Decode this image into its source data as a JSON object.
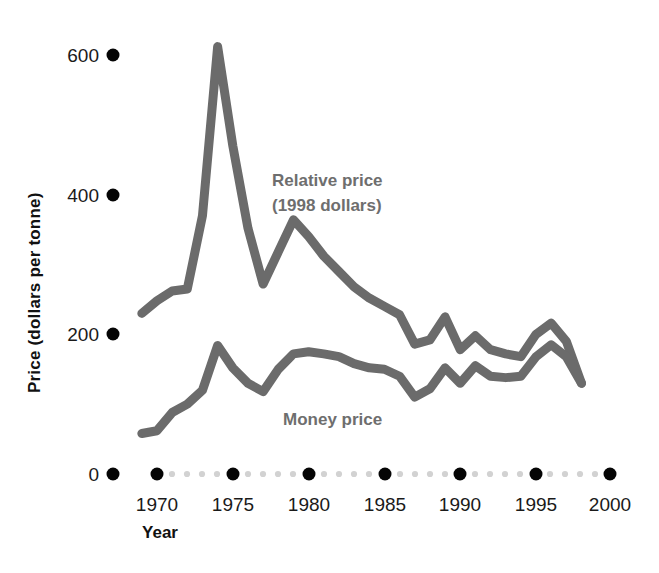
{
  "figure": {
    "background_color": "#ffffff",
    "series_color": "#6b6b6b",
    "label_color": "#6e6e6e",
    "tick_color": "#050505",
    "minor_tick_color": "#d2d2d2"
  },
  "axes": {
    "y_axis_title": "Price (dollars per tonne)",
    "x_axis_title": "Year",
    "y_ticks": [
      "0",
      "200",
      "400",
      "600"
    ],
    "x_ticks": [
      "1970",
      "1975",
      "1980",
      "1985",
      "1990",
      "1995",
      "2000"
    ]
  },
  "annotations": {
    "relative_price_line1": "Relative price",
    "relative_price_line2": "(1998 dollars)",
    "money_price": "Money price"
  },
  "chart_data": {
    "type": "line",
    "title": "",
    "xlabel": "Year",
    "ylabel": "Price (dollars per tonne)",
    "xlim": [
      1968,
      2001
    ],
    "ylim": [
      0,
      680
    ],
    "grid": false,
    "legend": "inline-annotations",
    "x": [
      1969,
      1970,
      1971,
      1972,
      1973,
      1974,
      1975,
      1976,
      1977,
      1978,
      1979,
      1980,
      1981,
      1982,
      1983,
      1984,
      1985,
      1986,
      1987,
      1988,
      1989,
      1990,
      1991,
      1992,
      1993,
      1994,
      1995,
      1996,
      1997,
      1998
    ],
    "series": [
      {
        "name": "Relative price (1998 dollars)",
        "color": "#6b6b6b",
        "values": [
          230,
          248,
          262,
          265,
          370,
          612,
          470,
          352,
          272,
          318,
          364,
          340,
          312,
          290,
          268,
          252,
          240,
          228,
          186,
          192,
          225,
          178,
          198,
          178,
          172,
          168,
          200,
          216,
          190,
          130
        ]
      },
      {
        "name": "Money price",
        "color": "#6b6b6b",
        "values": [
          58,
          62,
          88,
          100,
          120,
          184,
          152,
          130,
          118,
          150,
          172,
          175,
          172,
          168,
          158,
          152,
          150,
          140,
          110,
          122,
          152,
          130,
          155,
          140,
          138,
          140,
          168,
          185,
          168,
          130
        ]
      }
    ],
    "axis_tick_dot_style": "filled-circles-with-small-dotted-minor-ticks"
  }
}
